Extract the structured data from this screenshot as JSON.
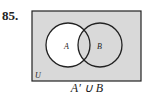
{
  "problem_number": "85.",
  "diagram": {
    "universe_label": "U",
    "sets": [
      {
        "label": "A",
        "cx": 68,
        "cy": 45,
        "r": 22
      },
      {
        "label": "B",
        "cx": 100,
        "cy": 45,
        "r": 22
      }
    ],
    "shaded_region": "A′ ∪ B",
    "colors": {
      "shade": "#d9d9d9",
      "unshaded": "#ffffff",
      "stroke": "#222222"
    }
  },
  "caption": "A′ ∪ B"
}
